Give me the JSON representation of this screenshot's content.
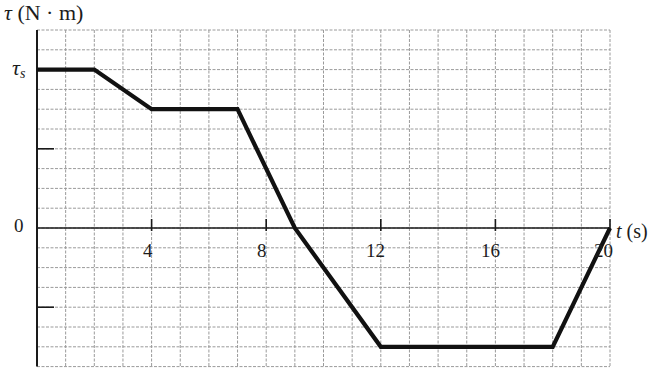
{
  "chart_data": {
    "type": "line",
    "title": "",
    "xlabel": "t (s)",
    "ylabel": "τ (N · m)",
    "x_ticks": [
      4,
      8,
      12,
      16,
      20
    ],
    "y_ticks_labeled": [
      {
        "label": "τ_s",
        "value_units": 8
      },
      {
        "label": "0",
        "value_units": 0
      }
    ],
    "xlim": [
      0,
      20
    ],
    "ylim_grid_units": [
      -7,
      10
    ],
    "grid": true,
    "legend": null,
    "y_unit_note": "y values in grid units; τ_s corresponds to 8 grid units",
    "series": [
      {
        "name": "torque",
        "points": [
          {
            "t": 0,
            "y": 8
          },
          {
            "t": 2,
            "y": 8
          },
          {
            "t": 4,
            "y": 6
          },
          {
            "t": 7,
            "y": 6
          },
          {
            "t": 9,
            "y": 0
          },
          {
            "t": 12,
            "y": -6
          },
          {
            "t": 18,
            "y": -6
          },
          {
            "t": 20,
            "y": 0
          }
        ]
      }
    ]
  },
  "labels": {
    "y_axis_symbol": "τ",
    "y_axis_unit": " (N · m)",
    "tau_s_symbol": "τ",
    "tau_s_sub": "s",
    "zero": "0",
    "x_axis_symbol": "t",
    "x_axis_unit": " (s)",
    "x_ticks": [
      "4",
      "8",
      "12",
      "16",
      "20"
    ]
  },
  "colors": {
    "grid": "#9a9a9a",
    "axis": "#1a1a1a",
    "curve": "#111111"
  }
}
